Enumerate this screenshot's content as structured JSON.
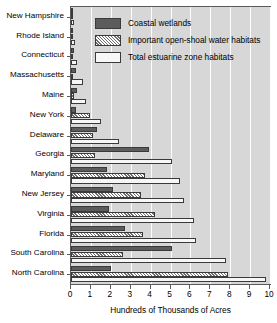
{
  "chart_data": {
    "type": "bar",
    "orientation": "horizontal",
    "title": "",
    "xlabel": "Hundreds of Thousands of Acres",
    "ylabel": "",
    "xlim": [
      0,
      10
    ],
    "xticks": [
      "0",
      "1",
      "2",
      "3",
      "4",
      "5",
      "6",
      "7",
      "8",
      "9",
      "10"
    ],
    "grid": true,
    "legend_position": "upper-right-inside",
    "categories": [
      "New Hampshire",
      "Rhode Island",
      "Connecticut",
      "Massachusetts",
      "Maine",
      "New York",
      "Delaware",
      "Georgia",
      "Maryland",
      "New Jersey",
      "Virginia",
      "Florida",
      "South Carolina",
      "North Carolina"
    ],
    "series": [
      {
        "name": "Coastal wetlands",
        "values": [
          0.05,
          0.05,
          0.15,
          0.25,
          0.3,
          0.25,
          1.3,
          3.9,
          1.8,
          2.1,
          1.9,
          2.7,
          5.1,
          2.0
        ]
      },
      {
        "name": "Important open-shoal water habitats",
        "values": [
          0.05,
          0.05,
          0.05,
          0.1,
          0.15,
          0.95,
          1.1,
          1.2,
          3.7,
          3.5,
          4.2,
          3.6,
          2.6,
          7.9
        ]
      },
      {
        "name": "Total estuarine zone habitats",
        "values": [
          0.15,
          0.2,
          0.3,
          0.6,
          0.75,
          1.5,
          2.4,
          5.1,
          5.5,
          5.7,
          6.2,
          6.3,
          7.8,
          9.8
        ]
      }
    ]
  },
  "legend": {
    "entries": [
      {
        "label": "Coastal wetlands",
        "swatch": "coastal"
      },
      {
        "label": "Important open-shoal water habitats",
        "swatch": "shoal"
      },
      {
        "label": "Total estuarine zone habitats",
        "swatch": "total"
      }
    ]
  },
  "colors": {
    "coastal_wetlands": "#5c5c5c",
    "open_shoal_hatch": "#6e6e6e",
    "total_estuarine": "#f7f7f7",
    "plot_background": "#d7d7d7",
    "gridline": "#fdfdfd",
    "axis": "#5a5a5a"
  }
}
